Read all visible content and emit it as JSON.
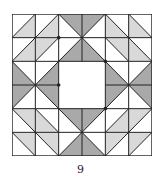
{
  "figure": {
    "caption": "9",
    "grid_size": 6,
    "colors": {
      "light": "#d9d9d9",
      "dark": "#a9a9a9",
      "line": "#222222",
      "background": "#ffffff"
    },
    "cells": [
      [
        {
          "d": "/",
          "s": "br",
          "c": "light"
        },
        {
          "d": "/",
          "s": "br",
          "c": "light"
        },
        {
          "d": "\\",
          "s": "tr",
          "c": "dark"
        },
        {
          "d": "/",
          "s": "tl",
          "c": "dark"
        },
        {
          "d": "\\",
          "s": "bl",
          "c": "light"
        },
        {
          "d": "\\",
          "s": "bl",
          "c": "light"
        }
      ],
      [
        {
          "d": "/",
          "s": "br",
          "c": "light"
        },
        {
          "d": "/",
          "s": "tl",
          "c": "light"
        },
        {
          "d": "/",
          "s": "br",
          "c": "dark"
        },
        {
          "d": "\\",
          "s": "bl",
          "c": "dark"
        },
        {
          "d": "\\",
          "s": "tr",
          "c": "light"
        },
        {
          "d": "\\",
          "s": "bl",
          "c": "light"
        }
      ],
      [
        {
          "d": "\\",
          "s": "bl",
          "c": "dark"
        },
        {
          "d": "/",
          "s": "br",
          "c": "dark"
        },
        {
          "d": "",
          "s": "",
          "c": ""
        },
        {
          "d": "",
          "s": "",
          "c": ""
        },
        {
          "d": "\\",
          "s": "bl",
          "c": "dark"
        },
        {
          "d": "/",
          "s": "br",
          "c": "dark"
        }
      ],
      [
        {
          "d": "/",
          "s": "tl",
          "c": "dark"
        },
        {
          "d": "\\",
          "s": "tr",
          "c": "dark"
        },
        {
          "d": "",
          "s": "",
          "c": ""
        },
        {
          "d": "",
          "s": "",
          "c": ""
        },
        {
          "d": "/",
          "s": "tl",
          "c": "dark"
        },
        {
          "d": "\\",
          "s": "tr",
          "c": "dark"
        }
      ],
      [
        {
          "d": "\\",
          "s": "tr",
          "c": "light"
        },
        {
          "d": "\\",
          "s": "bl",
          "c": "light"
        },
        {
          "d": "\\",
          "s": "tr",
          "c": "dark"
        },
        {
          "d": "/",
          "s": "tl",
          "c": "dark"
        },
        {
          "d": "/",
          "s": "br",
          "c": "light"
        },
        {
          "d": "/",
          "s": "tl",
          "c": "light"
        }
      ],
      [
        {
          "d": "\\",
          "s": "tr",
          "c": "light"
        },
        {
          "d": "\\",
          "s": "tr",
          "c": "light"
        },
        {
          "d": "/",
          "s": "br",
          "c": "dark"
        },
        {
          "d": "\\",
          "s": "bl",
          "c": "dark"
        },
        {
          "d": "/",
          "s": "tl",
          "c": "light"
        },
        {
          "d": "/",
          "s": "tl",
          "c": "light"
        }
      ]
    ],
    "hub_points": [
      [
        2,
        1
      ],
      [
        4,
        2
      ],
      [
        2,
        3
      ],
      [
        4,
        4
      ]
    ]
  }
}
